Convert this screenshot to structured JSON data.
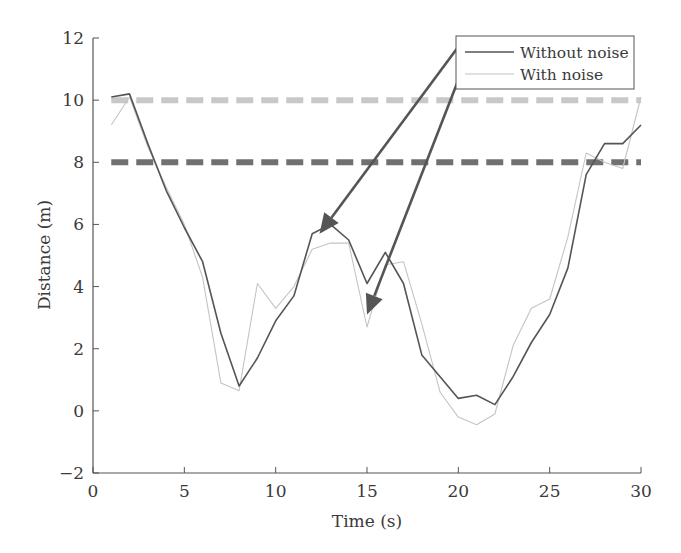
{
  "chart_data": {
    "type": "line",
    "title": "",
    "xlabel": "Time (s)",
    "ylabel": "Distance (m)",
    "xlim": [
      0,
      30
    ],
    "ylim": [
      -2,
      12
    ],
    "xticks": [
      0,
      5,
      10,
      15,
      20,
      25,
      30
    ],
    "yticks": [
      -2,
      0,
      2,
      4,
      6,
      8,
      10,
      12
    ],
    "xtick_labels": [
      "0",
      "5",
      "10",
      "15",
      "20",
      "25",
      "30"
    ],
    "ytick_labels": [
      "−2",
      "0",
      "2",
      "4",
      "6",
      "8",
      "10",
      "12"
    ],
    "grid": false,
    "legend_position": "upper right",
    "x": [
      1,
      2,
      3,
      4,
      5,
      6,
      7,
      8,
      9,
      10,
      11,
      12,
      13,
      14,
      15,
      16,
      17,
      18,
      19,
      20,
      21,
      22,
      23,
      24,
      25,
      26,
      27,
      28,
      29,
      30
    ],
    "series": [
      {
        "name": "Without noise",
        "color": "#555555",
        "width": 1.6,
        "values": [
          10.1,
          10.2,
          8.6,
          7.1,
          5.9,
          4.8,
          2.5,
          0.8,
          1.7,
          2.9,
          3.7,
          5.7,
          6.0,
          5.5,
          4.1,
          5.1,
          4.1,
          1.8,
          1.1,
          0.4,
          0.5,
          0.2,
          1.1,
          2.2,
          3.1,
          4.6,
          7.6,
          8.6,
          8.6,
          9.2
        ]
      },
      {
        "name": "With noise",
        "color": "#c4c4c4",
        "width": 1.1,
        "values": [
          9.2,
          10.1,
          8.5,
          7.2,
          6.0,
          4.3,
          0.9,
          0.65,
          4.1,
          3.3,
          4.0,
          5.2,
          5.4,
          5.4,
          2.7,
          4.7,
          4.8,
          2.8,
          0.6,
          -0.2,
          -0.45,
          -0.1,
          2.1,
          3.3,
          3.6,
          5.6,
          8.3,
          8.0,
          7.8,
          10.1
        ]
      }
    ],
    "reference_lines": [
      {
        "y": 10,
        "style": "dashed",
        "color": "#c8c8c8",
        "width": 6,
        "x_range": [
          1,
          30
        ]
      },
      {
        "y": 8,
        "style": "dashed",
        "color": "#707070",
        "width": 6,
        "x_range": [
          1,
          30
        ]
      }
    ],
    "annotations": [
      {
        "type": "arrow",
        "from": [
          20.1,
          11.8
        ],
        "to": [
          12.4,
          5.7
        ],
        "color": "#555555",
        "target": "Without noise"
      },
      {
        "type": "arrow",
        "from": [
          20.1,
          10.8
        ],
        "to": [
          15.0,
          3.1
        ],
        "color": "#555555",
        "target": "With noise"
      }
    ]
  },
  "legend": {
    "items": [
      {
        "label": "Without noise",
        "color": "#555555"
      },
      {
        "label": "With noise",
        "color": "#c4c4c4"
      }
    ]
  },
  "axes": {
    "xlabel": "Time (s)",
    "ylabel": "Distance (m)"
  }
}
